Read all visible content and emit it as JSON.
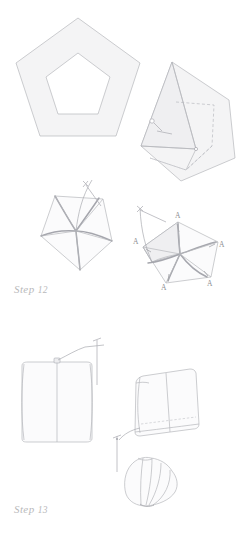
{
  "page": {
    "background_color": "#ffffff",
    "width": 242,
    "height": 547
  },
  "palette": {
    "fabric_fill": "#f4f4f5",
    "fabric_fill_shadow": "#ececee",
    "outline": "#b6b7bc",
    "outline_dark": "#9a9ba1",
    "fold_dashed": "#b9bac0",
    "thread": "#a9aab0",
    "needle": "#b2b3b9",
    "label_text": "#b9b9bb",
    "vertex_text": "#8d8d92"
  },
  "steps": [
    {
      "id": "step-12",
      "label_word": "Step",
      "label_number": "12",
      "figures": [
        {
          "name": "pentagon-ring-flat",
          "caption": "Flat pentagon with inner pentagon opening"
        },
        {
          "name": "pentagon-folded-flap",
          "caption": "Pentagon with corner folded over, dashed fold lines, pin inserted"
        },
        {
          "name": "pentagon-gathered-left",
          "caption": "Pentagon gathered at centre with needle and thread"
        },
        {
          "name": "pentagon-gathered-labeled",
          "caption": "Pentagon gathered at centre with five corner points marked A"
        }
      ],
      "vertex_marks": [
        "A",
        "A",
        "A",
        "A",
        "A"
      ]
    },
    {
      "id": "step-13",
      "label_word": "Step",
      "label_number": "13",
      "figures": [
        {
          "name": "folded-panel-front",
          "caption": "Folded fabric panel seen flat with centre crease and pin at top"
        },
        {
          "name": "folded-panel-angled",
          "caption": "Folded fabric panel seen at an angle with dashed stitch line and needle"
        },
        {
          "name": "petal-fan",
          "caption": "Gathered petal fan shape formed from the folded panels"
        }
      ]
    }
  ]
}
